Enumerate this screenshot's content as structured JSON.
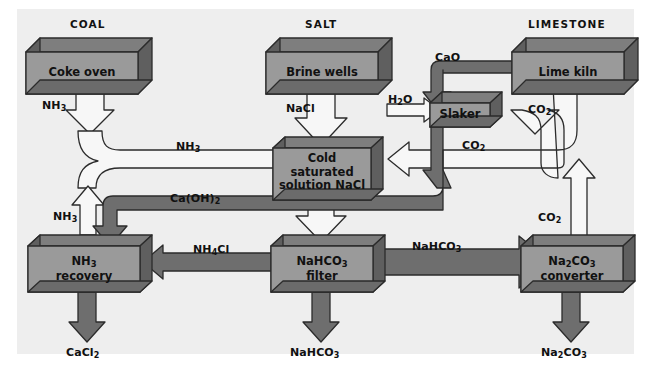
{
  "diagram": {
    "colors": {
      "panel_background": "#eeeeee",
      "box_face": "#9a9a9a",
      "box_top": "#7e7e7e",
      "box_side": "#6b6b6b",
      "dark_pipe": "#6e6e6e",
      "white_arrow": "#f7f7f7",
      "outline": "#2b2b2b",
      "text": "#111111"
    },
    "headers": [
      {
        "id": "coal",
        "label": "COAL"
      },
      {
        "id": "salt",
        "label": "SALT"
      },
      {
        "id": "limestone",
        "label": "LIMESTONE"
      }
    ],
    "units": [
      {
        "id": "coke-oven",
        "lines": [
          "Coke oven"
        ]
      },
      {
        "id": "brine-wells",
        "lines": [
          "Brine wells"
        ]
      },
      {
        "id": "lime-kiln",
        "lines": [
          "Lime kiln"
        ]
      },
      {
        "id": "slaker",
        "lines": [
          "Slaker"
        ]
      },
      {
        "id": "cold-saturated",
        "lines": [
          "Cold",
          "saturated",
          "solution NaCl"
        ]
      },
      {
        "id": "nh3-recovery",
        "lines": [
          "NH3",
          "recovery"
        ]
      },
      {
        "id": "nahco3-filter",
        "lines": [
          "NaHCO3",
          "filter"
        ]
      },
      {
        "id": "na2co3-converter",
        "lines": [
          "Na2CO3",
          "converter"
        ]
      }
    ],
    "stream_labels": [
      {
        "id": "nh3-from-coke-oven",
        "text": "NH3"
      },
      {
        "id": "nh3-to-solution",
        "text": "NH3"
      },
      {
        "id": "nh3-recycle",
        "text": "NH3"
      },
      {
        "id": "nacl-from-brine",
        "text": "NaCl"
      },
      {
        "id": "h2o-to-slaker",
        "text": "H2O"
      },
      {
        "id": "cao-to-slaker",
        "text": "CaO"
      },
      {
        "id": "co2-from-lime-kiln",
        "text": "CO2"
      },
      {
        "id": "co2-to-solution",
        "text": "CO2"
      },
      {
        "id": "co2-from-converter",
        "text": "CO2"
      },
      {
        "id": "caoh2-to-recovery",
        "text": "Ca(OH)2"
      },
      {
        "id": "nh4cl-to-recovery",
        "text": "NH4Cl"
      },
      {
        "id": "nahco3-to-converter",
        "text": "NaHCO3"
      }
    ],
    "outputs": [
      {
        "id": "cacl2-output",
        "text": "CaCl2"
      },
      {
        "id": "nahco3-output",
        "text": "NaHCO3"
      },
      {
        "id": "na2co3-output",
        "text": "Na2CO3"
      }
    ]
  }
}
